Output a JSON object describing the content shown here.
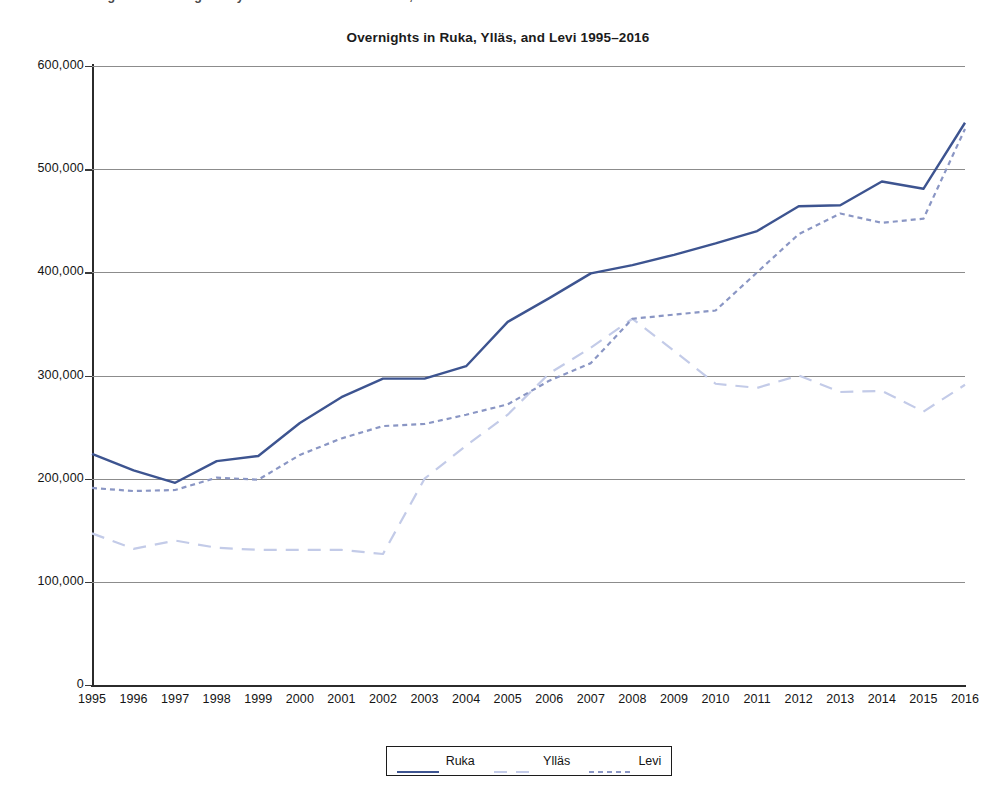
{
  "page": {
    "cut_off_caption": "Figure 3. Overnight stays in the ski resorts of Ruka, Ylläs and Levi"
  },
  "chart_data": {
    "type": "line",
    "title": "Overnights in Ruka, Ylläs, and Levi 1995–2016",
    "xlabel": "",
    "ylabel": "",
    "xlim": [
      1995,
      2016
    ],
    "ylim": [
      0,
      600000
    ],
    "grid": true,
    "legend_position": "bottom",
    "y_ticks": [
      0,
      100000,
      200000,
      300000,
      400000,
      500000,
      600000
    ],
    "y_tick_labels": [
      "0",
      "100,000",
      "200,000",
      "300,000",
      "400,000",
      "500,000",
      "600,000"
    ],
    "categories": [
      1995,
      1996,
      1997,
      1998,
      1999,
      2000,
      2001,
      2002,
      2003,
      2004,
      2005,
      2006,
      2007,
      2008,
      2009,
      2010,
      2011,
      2012,
      2013,
      2014,
      2015,
      2016
    ],
    "x_tick_labels": [
      "1995",
      "1996",
      "1997",
      "1998",
      "1999",
      "2000",
      "2001",
      "2002",
      "2003",
      "2004",
      "2005",
      "2006",
      "2007",
      "2008",
      "2009",
      "2010",
      "2011",
      "2012",
      "2013",
      "2014",
      "2015",
      "2016"
    ],
    "series": [
      {
        "name": "Ruka",
        "color": "#3d5490",
        "style": "solid",
        "values": [
          224000,
          208000,
          196000,
          217000,
          222000,
          254000,
          279000,
          297000,
          297000,
          309000,
          352000,
          375000,
          399000,
          407000,
          417000,
          428000,
          440000,
          464000,
          465000,
          488000,
          481000,
          545000
        ]
      },
      {
        "name": "Ylläs",
        "color": "#c3cbe8",
        "style": "long-dash",
        "values": [
          147000,
          132000,
          140000,
          133000,
          131000,
          131000,
          131000,
          127000,
          200000,
          232000,
          262000,
          302000,
          327000,
          355000,
          324000,
          292000,
          288000,
          300000,
          284000,
          285000,
          265000,
          291000
        ]
      },
      {
        "name": "Levi",
        "color": "#8a96c4",
        "style": "short-dash",
        "values": [
          191000,
          188000,
          189000,
          201000,
          199000,
          223000,
          239000,
          251000,
          253000,
          262000,
          272000,
          295000,
          312000,
          355000,
          359000,
          363000,
          400000,
          437000,
          457000,
          448000,
          452000,
          539000
        ]
      }
    ]
  },
  "legend": {
    "entries": [
      {
        "label": "Ruka"
      },
      {
        "label": "Ylläs"
      },
      {
        "label": "Levi"
      }
    ]
  }
}
